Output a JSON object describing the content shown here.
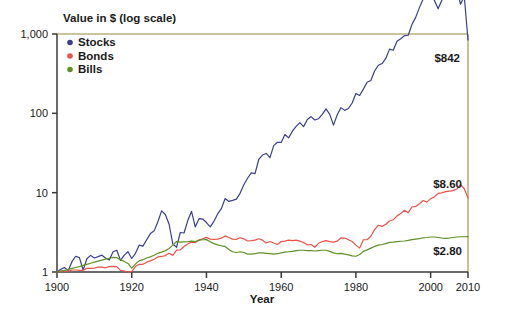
{
  "chart_data": {
    "type": "line",
    "title": "Value in $ (log scale)",
    "xlabel": "Year",
    "ylabel": "Value in $ (log scale)",
    "yscale": "log",
    "ylim": [
      1,
      1000
    ],
    "xlim": [
      1900,
      2010
    ],
    "grid": false,
    "legend_position": "top-left-inside",
    "ytick_labels": [
      "1,000",
      "100",
      "10",
      "1"
    ],
    "ytick_values": [
      1000,
      100,
      10,
      1
    ],
    "xtick_labels": [
      "1900",
      "1920",
      "1940",
      "1960",
      "1980",
      "2000",
      "2010"
    ],
    "xtick_values": [
      1900,
      1920,
      1940,
      1960,
      1980,
      2000,
      2010
    ],
    "colors": {
      "stocks": "#3b3f8c",
      "bonds": "#e8534a",
      "bills": "#5f9127",
      "axis": "#3a3a3a",
      "frame": "#bdae7e",
      "text": "#1a1a1a"
    },
    "annotations": [
      {
        "name": "stocks-end-value",
        "text": "$842",
        "x": 2010,
        "y": 842
      },
      {
        "name": "bonds-end-value",
        "text": "$8.60",
        "x": 2010,
        "y": 8.6
      },
      {
        "name": "bills-end-value",
        "text": "$2.80",
        "x": 2010,
        "y": 2.8
      }
    ],
    "x": [
      1900,
      1901,
      1902,
      1903,
      1904,
      1905,
      1906,
      1907,
      1908,
      1909,
      1910,
      1911,
      1912,
      1913,
      1914,
      1915,
      1916,
      1917,
      1918,
      1919,
      1920,
      1921,
      1922,
      1923,
      1924,
      1925,
      1926,
      1927,
      1928,
      1929,
      1930,
      1931,
      1932,
      1933,
      1934,
      1935,
      1936,
      1937,
      1938,
      1939,
      1940,
      1941,
      1942,
      1943,
      1944,
      1945,
      1946,
      1947,
      1948,
      1949,
      1950,
      1951,
      1952,
      1953,
      1954,
      1955,
      1956,
      1957,
      1958,
      1959,
      1960,
      1961,
      1962,
      1963,
      1964,
      1965,
      1966,
      1967,
      1968,
      1969,
      1970,
      1971,
      1972,
      1973,
      1974,
      1975,
      1976,
      1977,
      1978,
      1979,
      1980,
      1981,
      1982,
      1983,
      1984,
      1985,
      1986,
      1987,
      1988,
      1989,
      1990,
      1991,
      1992,
      1993,
      1994,
      1995,
      1996,
      1997,
      1998,
      1999,
      2000,
      2001,
      2002,
      2003,
      2004,
      2005,
      2006,
      2007,
      2008,
      2009,
      2010
    ],
    "series": [
      {
        "name": "Stocks",
        "color": "#3b3f8c",
        "end_label": "$842",
        "end_value": 842,
        "values": [
          1.0,
          1.08,
          1.14,
          1.04,
          1.35,
          1.58,
          1.52,
          1.06,
          1.47,
          1.62,
          1.5,
          1.56,
          1.63,
          1.5,
          1.42,
          1.8,
          1.88,
          1.4,
          1.63,
          1.8,
          1.48,
          1.72,
          2.18,
          2.12,
          2.55,
          3.05,
          3.3,
          4.3,
          5.9,
          5.3,
          4.0,
          2.25,
          2.05,
          3.15,
          3.1,
          4.45,
          5.8,
          3.7,
          4.7,
          4.65,
          4.2,
          3.7,
          4.35,
          5.4,
          6.3,
          8.45,
          7.75,
          8.0,
          8.3,
          9.8,
          12.6,
          15.2,
          17.8,
          17.4,
          26.2,
          29.8,
          31.2,
          27.6,
          39.2,
          43.2,
          43.0,
          54.0,
          49.0,
          59.5,
          68.5,
          76.5,
          68.0,
          83.5,
          91.0,
          82.5,
          85.5,
          97.0,
          114.0,
          97.0,
          71.0,
          96.0,
          118.0,
          109.0,
          115.0,
          135.0,
          178.0,
          168.0,
          202.0,
          246.0,
          260.0,
          342.0,
          404.0,
          424.0,
          492.0,
          645.0,
          623.0,
          810.0,
          870.0,
          955.0,
          965.0,
          1320.0,
          1620.0,
          2150.0,
          2760.0,
          3330.0,
          3040.0,
          2670.0,
          2080.0,
          2670.0,
          2960.0,
          3100.0,
          3580.0,
          3770.0,
          2370.0,
          2990.0,
          842.0
        ]
      },
      {
        "name": "Bonds",
        "color": "#e8534a",
        "end_label": "$8.60",
        "end_value": 8.6,
        "values": [
          1.0,
          1.02,
          1.03,
          1.02,
          1.06,
          1.06,
          1.05,
          1.05,
          1.11,
          1.11,
          1.12,
          1.15,
          1.15,
          1.13,
          1.17,
          1.18,
          1.17,
          1.05,
          1.03,
          1.0,
          1.01,
          1.17,
          1.25,
          1.25,
          1.33,
          1.38,
          1.45,
          1.55,
          1.57,
          1.61,
          1.72,
          1.62,
          1.89,
          1.9,
          2.1,
          2.25,
          2.38,
          2.35,
          2.52,
          2.62,
          2.73,
          2.6,
          2.58,
          2.6,
          2.67,
          2.85,
          2.72,
          2.6,
          2.58,
          2.7,
          2.62,
          2.46,
          2.48,
          2.52,
          2.62,
          2.52,
          2.32,
          2.42,
          2.32,
          2.22,
          2.42,
          2.45,
          2.52,
          2.48,
          2.52,
          2.45,
          2.35,
          2.2,
          2.22,
          2.05,
          2.3,
          2.42,
          2.48,
          2.42,
          2.38,
          2.45,
          2.7,
          2.68,
          2.55,
          2.42,
          2.18,
          2.0,
          2.55,
          2.55,
          2.82,
          3.42,
          3.88,
          3.76,
          4.0,
          4.4,
          4.55,
          5.1,
          5.45,
          6.0,
          5.6,
          6.6,
          6.7,
          7.25,
          7.95,
          7.6,
          8.4,
          8.85,
          9.8,
          9.95,
          10.3,
          10.45,
          10.6,
          11.1,
          12.6,
          11.2,
          8.6
        ]
      },
      {
        "name": "Bills",
        "color": "#5f9127",
        "end_label": "$2.80",
        "end_value": 2.8,
        "values": [
          1.0,
          1.03,
          1.05,
          1.08,
          1.11,
          1.14,
          1.17,
          1.21,
          1.25,
          1.29,
          1.33,
          1.37,
          1.41,
          1.45,
          1.49,
          1.53,
          1.52,
          1.42,
          1.36,
          1.28,
          1.12,
          1.26,
          1.38,
          1.43,
          1.5,
          1.55,
          1.63,
          1.72,
          1.78,
          1.86,
          1.98,
          2.18,
          2.42,
          2.38,
          2.4,
          2.42,
          2.45,
          2.42,
          2.52,
          2.55,
          2.56,
          2.4,
          2.28,
          2.2,
          2.14,
          2.1,
          1.92,
          1.8,
          1.76,
          1.8,
          1.76,
          1.68,
          1.68,
          1.7,
          1.74,
          1.74,
          1.72,
          1.7,
          1.68,
          1.7,
          1.74,
          1.78,
          1.8,
          1.82,
          1.86,
          1.88,
          1.88,
          1.86,
          1.86,
          1.84,
          1.86,
          1.88,
          1.88,
          1.82,
          1.74,
          1.7,
          1.72,
          1.68,
          1.64,
          1.6,
          1.58,
          1.66,
          1.82,
          1.9,
          2.0,
          2.1,
          2.18,
          2.22,
          2.28,
          2.36,
          2.38,
          2.42,
          2.44,
          2.46,
          2.5,
          2.56,
          2.6,
          2.64,
          2.7,
          2.72,
          2.76,
          2.76,
          2.72,
          2.68,
          2.66,
          2.68,
          2.72,
          2.76,
          2.78,
          2.78,
          2.8
        ]
      }
    ]
  },
  "legend": {
    "items": [
      {
        "label": "Stocks",
        "color": "#3b3f8c"
      },
      {
        "label": "Bonds",
        "color": "#e8534a"
      },
      {
        "label": "Bills",
        "color": "#5f9127"
      }
    ]
  }
}
